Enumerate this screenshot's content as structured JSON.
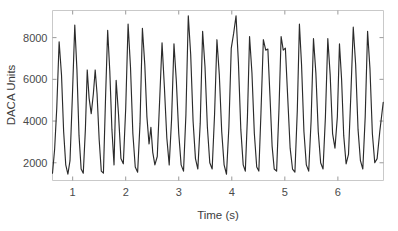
{
  "chart_data": {
    "type": "line",
    "title": "",
    "xlabel": "Time (s)",
    "ylabel": "DACA Units",
    "xlim": [
      0.62,
      6.86
    ],
    "ylim": [
      1150,
      9300
    ],
    "xticks": [
      1,
      2,
      3,
      4,
      5,
      6
    ],
    "xticklabels": [
      "1",
      "2",
      "3",
      "4",
      "5",
      "6"
    ],
    "yticks": [
      2000,
      4000,
      6000,
      8000
    ],
    "yticklabels": [
      "2000",
      "4000",
      "6000",
      "8000"
    ],
    "grid": false,
    "legend": null,
    "legend_position": "none",
    "line_color": "#2b2b2b",
    "background_color": "#ffffff",
    "axis_color": "#c9c9c9",
    "series": [
      {
        "name": "DACA signal",
        "x": [
          0.62,
          0.66,
          0.7,
          0.745,
          0.79,
          0.83,
          0.87,
          0.91,
          0.95,
          0.995,
          1.04,
          1.08,
          1.12,
          1.16,
          1.2,
          1.24,
          1.275,
          1.31,
          1.35,
          1.39,
          1.425,
          1.46,
          1.5,
          1.54,
          1.58,
          1.62,
          1.66,
          1.7,
          1.74,
          1.78,
          1.82,
          1.865,
          1.91,
          1.955,
          2.0,
          2.045,
          2.09,
          2.135,
          2.18,
          2.225,
          2.27,
          2.315,
          2.36,
          2.4,
          2.44,
          2.475,
          2.51,
          2.55,
          2.595,
          2.64,
          2.685,
          2.73,
          2.775,
          2.82,
          2.865,
          2.91,
          2.955,
          3.0,
          3.045,
          3.09,
          3.135,
          3.18,
          3.225,
          3.27,
          3.315,
          3.36,
          3.405,
          3.45,
          3.495,
          3.54,
          3.585,
          3.63,
          3.675,
          3.72,
          3.765,
          3.81,
          3.855,
          3.9,
          3.945,
          3.99,
          4.035,
          4.08,
          4.125,
          4.17,
          4.215,
          4.255,
          4.295,
          4.335,
          4.38,
          4.425,
          4.47,
          4.51,
          4.55,
          4.595,
          4.64,
          4.68,
          4.72,
          4.76,
          4.8,
          4.845,
          4.89,
          4.93,
          4.97,
          5.01,
          5.055,
          5.1,
          5.145,
          5.19,
          5.235,
          5.275,
          5.315,
          5.36,
          5.405,
          5.45,
          5.495,
          5.54,
          5.585,
          5.63,
          5.675,
          5.72,
          5.765,
          5.81,
          5.855,
          5.9,
          5.945,
          5.99,
          6.03,
          6.07,
          6.11,
          6.155,
          6.2,
          6.245,
          6.29,
          6.335,
          6.38,
          6.425,
          6.47,
          6.515,
          6.56,
          6.605,
          6.65,
          6.695,
          6.74,
          6.79,
          6.855
        ],
        "y": [
          1500,
          2650,
          4600,
          7800,
          6200,
          3500,
          1900,
          1450,
          2100,
          5200,
          8600,
          6500,
          3300,
          1700,
          1500,
          3600,
          6450,
          5100,
          4350,
          5300,
          6450,
          5300,
          3100,
          1600,
          1500,
          5100,
          8350,
          6400,
          3600,
          1900,
          5950,
          4300,
          2200,
          1950,
          4600,
          8650,
          6600,
          3400,
          1800,
          1550,
          3900,
          8450,
          6700,
          4200,
          2900,
          3700,
          2500,
          1900,
          2300,
          5000,
          7750,
          5600,
          3200,
          1900,
          4100,
          7700,
          5900,
          3400,
          1900,
          1600,
          4300,
          9050,
          7200,
          4000,
          2200,
          1700,
          3900,
          8300,
          6600,
          3700,
          2000,
          1700,
          4300,
          7900,
          6200,
          3500,
          1900,
          1450,
          3700,
          7500,
          8200,
          9050,
          6800,
          3600,
          1900,
          1600,
          4200,
          8050,
          6300,
          3400,
          1800,
          1600,
          4400,
          7900,
          7400,
          7450,
          5200,
          2800,
          1700,
          1600,
          4600,
          8050,
          7400,
          7500,
          5100,
          2700,
          1700,
          1550,
          4500,
          8650,
          6700,
          3500,
          1900,
          1600,
          4000,
          7950,
          6300,
          3500,
          2000,
          1700,
          4200,
          7950,
          6200,
          3400,
          2700,
          4200,
          7700,
          6000,
          3300,
          1950,
          2400,
          5300,
          8500,
          6700,
          3600,
          2100,
          1700,
          4200,
          8300,
          6500,
          3400,
          2000,
          2200,
          3500,
          4900
        ]
      }
    ]
  }
}
